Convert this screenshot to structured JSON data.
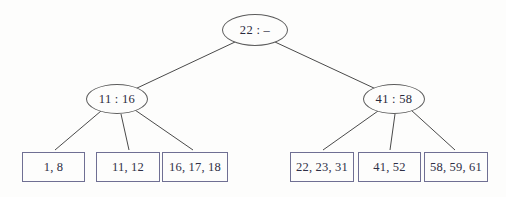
{
  "diagram": {
    "type": "search-tree",
    "background_color": "#fdfdfc",
    "edge_color": "#4a4a4a",
    "ellipse_border_color": "#5c5c5c",
    "box_border_color": "#6f6f93",
    "text_color": "#2a2a3c",
    "root": {
      "label": "22 : –",
      "cx": 255,
      "cy": 30,
      "rx": 33,
      "ry": 16
    },
    "internal_nodes": [
      {
        "label": "11 : 16",
        "cx": 117,
        "cy": 99,
        "rx": 31,
        "ry": 15
      },
      {
        "label": "41 : 58",
        "cx": 394,
        "cy": 99,
        "rx": 31,
        "ry": 15
      }
    ],
    "leaves": [
      {
        "label": "1, 8",
        "x": 22,
        "y": 152,
        "w": 63,
        "h": 30
      },
      {
        "label": "11, 12",
        "x": 96,
        "y": 152,
        "w": 64,
        "h": 30
      },
      {
        "label": "16, 17, 18",
        "x": 162,
        "y": 152,
        "w": 66,
        "h": 30
      },
      {
        "label": "22, 23, 31",
        "x": 290,
        "y": 152,
        "w": 64,
        "h": 30
      },
      {
        "label": "41, 52",
        "x": 358,
        "y": 152,
        "w": 63,
        "h": 30
      },
      {
        "label": "58, 59, 61",
        "x": 424,
        "y": 152,
        "w": 64,
        "h": 30
      }
    ],
    "edges": [
      {
        "name": "root-to-left-internal",
        "x1": 235,
        "y1": 42,
        "x2": 135,
        "y2": 89
      },
      {
        "name": "root-to-right-internal",
        "x1": 275,
        "y1": 42,
        "x2": 376,
        "y2": 89
      },
      {
        "name": "left-internal-to-leaf-1",
        "x1": 101,
        "y1": 111,
        "x2": 55,
        "y2": 150
      },
      {
        "name": "left-internal-to-leaf-2",
        "x1": 121,
        "y1": 114,
        "x2": 129,
        "y2": 150
      },
      {
        "name": "left-internal-to-leaf-3",
        "x1": 135,
        "y1": 110,
        "x2": 193,
        "y2": 150
      },
      {
        "name": "right-internal-to-leaf-4",
        "x1": 378,
        "y1": 111,
        "x2": 323,
        "y2": 150
      },
      {
        "name": "right-internal-to-leaf-5",
        "x1": 395,
        "y1": 114,
        "x2": 390,
        "y2": 150
      },
      {
        "name": "right-internal-to-leaf-6",
        "x1": 411,
        "y1": 110,
        "x2": 455,
        "y2": 150
      }
    ]
  }
}
